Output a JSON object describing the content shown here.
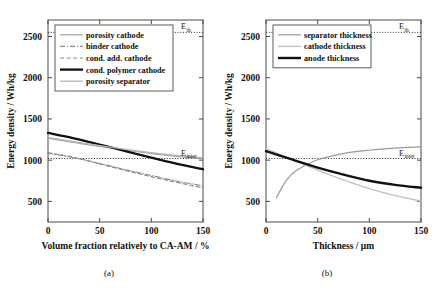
{
  "figure": {
    "panel_a_caption": "(a)",
    "panel_b_caption": "(b)"
  },
  "chart_data": [
    {
      "type": "line",
      "panel": "(a)",
      "title": "",
      "xlabel": "Volume fraction relatively to CA-AM / %",
      "ylabel": "Energy density / Wh/kg",
      "xlim": [
        0,
        150
      ],
      "ylim": [
        250,
        2700
      ],
      "xticks": [
        0,
        50,
        100,
        150
      ],
      "xtick_labels": [
        "0",
        "50",
        "100",
        "150"
      ],
      "yticks": [
        500,
        1000,
        1500,
        2000,
        2500
      ],
      "ytick_labels": [
        "500",
        "1000",
        "1500",
        "2000",
        "2500"
      ],
      "grid": false,
      "legend_position": "top-left",
      "annotations": [
        {
          "label": "E",
          "sub": "th",
          "value": 2550,
          "x": 150
        },
        {
          "label": "E",
          "sub": "inter",
          "value": 1020,
          "x": 150
        }
      ],
      "reference_lines": [
        {
          "name": "E_th",
          "value": 2550,
          "style": "dotted",
          "color": "#2b2b2b"
        },
        {
          "name": "E_inter",
          "value": 1020,
          "style": "dotted",
          "color": "#2b2b2b"
        }
      ],
      "series": [
        {
          "name": "porosity cathode",
          "color": "#9a9a9a",
          "style": "solid",
          "width": 1.1,
          "x": [
            0,
            25,
            50,
            75,
            100,
            125,
            150
          ],
          "values": [
            1265,
            1215,
            1165,
            1120,
            1080,
            1045,
            1015
          ]
        },
        {
          "name": "binder cathode",
          "color": "#8a8a8a",
          "style": "dashdot",
          "width": 1.1,
          "x": [
            0,
            25,
            50,
            75,
            100,
            125,
            150
          ],
          "values": [
            1085,
            1030,
            960,
            885,
            815,
            745,
            690
          ]
        },
        {
          "name": "cond. add. cathode",
          "color": "#8a8a8a",
          "style": "dashed",
          "width": 1.1,
          "x": [
            0,
            25,
            50,
            75,
            100,
            125,
            150
          ],
          "values": [
            1090,
            1035,
            955,
            875,
            800,
            730,
            665
          ]
        },
        {
          "name": "cond. polymer cathode",
          "color": "#111111",
          "style": "solid",
          "width": 2.3,
          "x": [
            0,
            25,
            50,
            75,
            100,
            125,
            150
          ],
          "values": [
            1330,
            1265,
            1190,
            1110,
            1030,
            955,
            890
          ]
        },
        {
          "name": "porosity separator",
          "color": "#b5b5b5",
          "style": "solid",
          "width": 1.3,
          "x": [
            0,
            25,
            50,
            75,
            100,
            125,
            150
          ],
          "values": [
            1275,
            1225,
            1175,
            1130,
            1090,
            1055,
            1030
          ]
        }
      ]
    },
    {
      "type": "line",
      "panel": "(b)",
      "title": "",
      "xlabel": "Thickness / μm",
      "ylabel": "Energy density / Wh/kg",
      "xlim": [
        0,
        150
      ],
      "ylim": [
        250,
        2700
      ],
      "xticks": [
        0,
        50,
        100,
        150
      ],
      "xtick_labels": [
        "0",
        "50",
        "100",
        "150"
      ],
      "yticks": [
        500,
        1000,
        1500,
        2000,
        2500
      ],
      "ytick_labels": [
        "500",
        "1000",
        "1500",
        "2000",
        "2500"
      ],
      "grid": false,
      "legend_position": "top-left",
      "annotations": [
        {
          "label": "E",
          "sub": "th",
          "value": 2550,
          "x": 150
        },
        {
          "label": "E",
          "sub": "inter",
          "value": 1020,
          "x": 150
        }
      ],
      "reference_lines": [
        {
          "name": "E_th",
          "value": 2550,
          "style": "dotted",
          "color": "#2b2b2b"
        },
        {
          "name": "E_inter",
          "value": 1020,
          "style": "dotted",
          "color": "#2b2b2b"
        }
      ],
      "series": [
        {
          "name": "separator thickness",
          "color": "#9a9a9a",
          "style": "solid",
          "width": 1.2,
          "x": [
            10,
            20,
            30,
            50,
            75,
            100,
            125,
            150
          ],
          "values": [
            545,
            760,
            880,
            1005,
            1080,
            1120,
            1145,
            1160
          ]
        },
        {
          "name": "cathode thickness",
          "color": "#c2c2c2",
          "style": "solid",
          "width": 1.4,
          "x": [
            0,
            25,
            50,
            75,
            100,
            125,
            150
          ],
          "values": [
            1140,
            1010,
            880,
            760,
            655,
            570,
            505
          ]
        },
        {
          "name": "anode thickness",
          "color": "#111111",
          "style": "solid",
          "width": 2.4,
          "x": [
            0,
            25,
            50,
            75,
            100,
            125,
            150
          ],
          "values": [
            1110,
            1010,
            910,
            825,
            750,
            700,
            665
          ]
        }
      ]
    }
  ]
}
